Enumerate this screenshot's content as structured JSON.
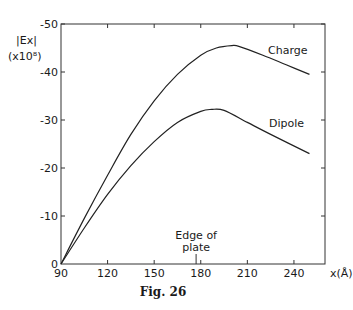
{
  "figure": {
    "caption": "Fig. 26",
    "ylabel_line1": "|Ex|",
    "ylabel_line2": "(x10⁸)",
    "xlabel": "x(Å)",
    "annotation_line1": "Edge of",
    "annotation_line2": "plate"
  },
  "chart_data": {
    "type": "line",
    "title": "",
    "xlabel": "x(Å)",
    "ylabel": "|Ex| (x10^8)",
    "xlim": [
      90,
      260
    ],
    "ylim": [
      0,
      50
    ],
    "xticks": [
      90,
      120,
      150,
      180,
      210,
      240
    ],
    "yticks": [
      0,
      10,
      20,
      30,
      40,
      50
    ],
    "xtick_labels": [
      "90",
      "120",
      "150",
      "180",
      "210",
      "240"
    ],
    "ytick_labels": [
      "0",
      "-10",
      "-20",
      "-30",
      "-40",
      "-50"
    ],
    "grid": false,
    "legend": "inline labels",
    "annotations": [
      {
        "text": "Edge of plate",
        "x": 177
      }
    ],
    "series": [
      {
        "name": "Charge",
        "x": [
          90,
          105,
          120,
          135,
          150,
          165,
          180,
          190,
          200,
          205,
          220,
          235,
          250
        ],
        "y": [
          0,
          9.5,
          18.5,
          27,
          34,
          39.5,
          43.5,
          45,
          45.5,
          45.3,
          43.5,
          41.5,
          39.5
        ]
      },
      {
        "name": "Dipole",
        "x": [
          90,
          105,
          120,
          135,
          150,
          165,
          180,
          187,
          195,
          210,
          225,
          250
        ],
        "y": [
          0,
          7.5,
          14.5,
          20.5,
          25.5,
          29.5,
          31.8,
          32.2,
          32,
          29.5,
          27,
          23
        ]
      }
    ]
  }
}
